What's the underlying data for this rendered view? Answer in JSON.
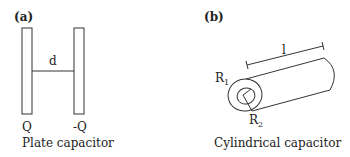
{
  "panel_a": {
    "tag": "(a)",
    "distance_label": "d",
    "left_charge": "Q",
    "right_charge": "-Q",
    "caption": "Plate capacitor"
  },
  "panel_b": {
    "tag": "(b)",
    "length_label": "l",
    "outer_radius_label": "R",
    "outer_radius_sub": "1",
    "inner_radius_label": "R",
    "inner_radius_sub": "2",
    "caption": "Cylindrical capacitor"
  },
  "colors": {
    "stroke": "#333333",
    "background": "#ffffff"
  }
}
